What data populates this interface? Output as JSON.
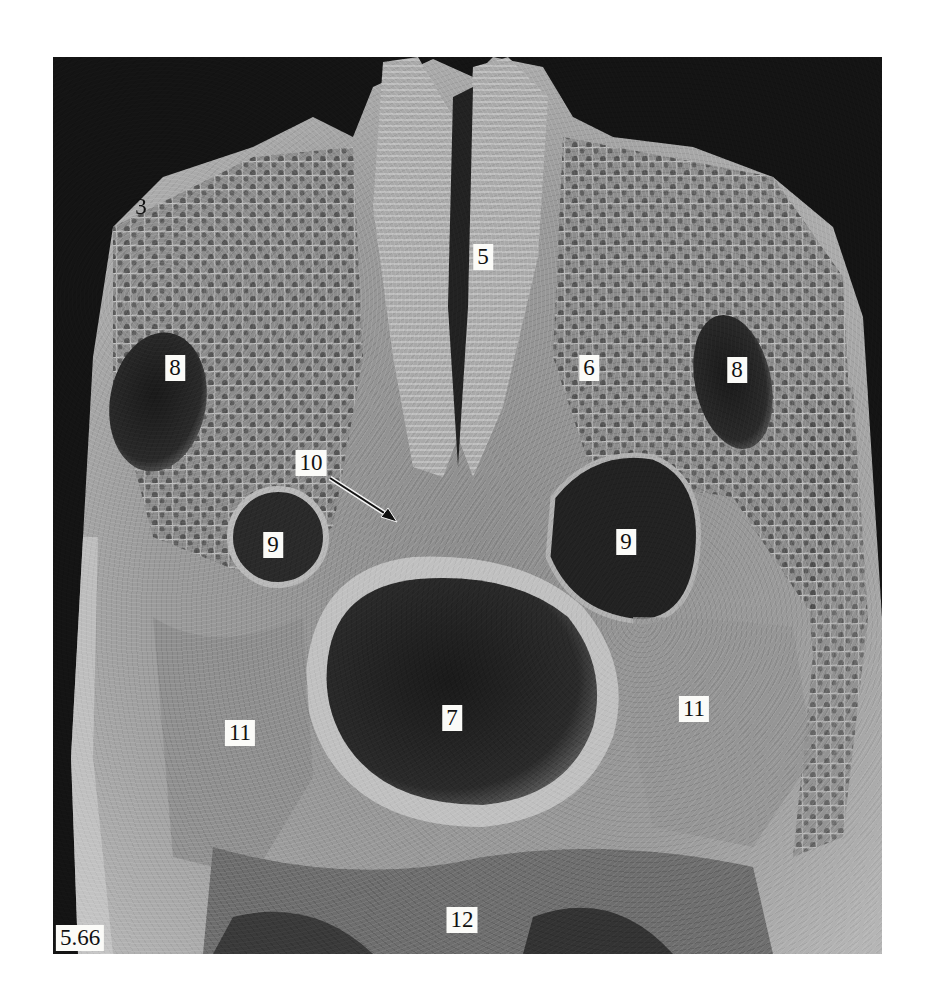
{
  "figure": {
    "id_label": "5.66",
    "type": "scanning electron micrograph, transverse section of embryo",
    "background_color": "#141414",
    "page_background": "#ffffff"
  },
  "labels": [
    {
      "key": "l3",
      "text": "3",
      "x": 141,
      "y": 207,
      "boxed": false
    },
    {
      "key": "l5",
      "text": "5",
      "x": 483,
      "y": 257,
      "boxed": true
    },
    {
      "key": "l8a",
      "text": "8",
      "x": 175,
      "y": 368,
      "boxed": true
    },
    {
      "key": "l6",
      "text": "6",
      "x": 589,
      "y": 368,
      "boxed": true
    },
    {
      "key": "l8b",
      "text": "8",
      "x": 737,
      "y": 370,
      "boxed": true
    },
    {
      "key": "l10",
      "text": "10",
      "x": 311,
      "y": 463,
      "boxed": true
    },
    {
      "key": "l9a",
      "text": "9",
      "x": 273,
      "y": 545,
      "boxed": true
    },
    {
      "key": "l9b",
      "text": "9",
      "x": 626,
      "y": 542,
      "boxed": true
    },
    {
      "key": "l7",
      "text": "7",
      "x": 452,
      "y": 718,
      "boxed": true
    },
    {
      "key": "l11a",
      "text": "11",
      "x": 240,
      "y": 733,
      "boxed": true
    },
    {
      "key": "l11b",
      "text": "11",
      "x": 694,
      "y": 709,
      "boxed": true
    },
    {
      "key": "l12",
      "text": "12",
      "x": 462,
      "y": 920,
      "boxed": true
    }
  ],
  "arrow": {
    "from": [
      330,
      478
    ],
    "to": [
      397,
      522
    ],
    "points_to_label": "10"
  }
}
